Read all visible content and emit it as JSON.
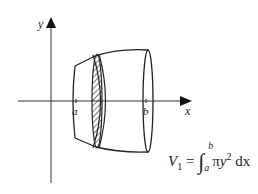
{
  "diagram": {
    "axes": {
      "x_label": "x",
      "y_label": "y"
    },
    "bounds": {
      "lower_label": "a",
      "upper_label": "b"
    },
    "formula": {
      "lhs_symbol": "V",
      "lhs_subscript": "1",
      "equals": "=",
      "integral_sign": "∫",
      "lower_limit": "a",
      "upper_limit": "b",
      "integrand_pi": "π",
      "integrand_var": "y",
      "integrand_power": "2",
      "differential": "dx"
    },
    "elements": [
      {
        "name": "y-axis",
        "type": "arrow"
      },
      {
        "name": "x-axis",
        "type": "arrow"
      },
      {
        "name": "solid-of-revolution",
        "type": "shape"
      },
      {
        "name": "shaded-disk-slice",
        "type": "hatched-ellipse"
      },
      {
        "name": "right-end-ellipse",
        "type": "ellipse"
      }
    ],
    "colors": {
      "stroke": "#222222",
      "background": "#ffffff"
    }
  }
}
